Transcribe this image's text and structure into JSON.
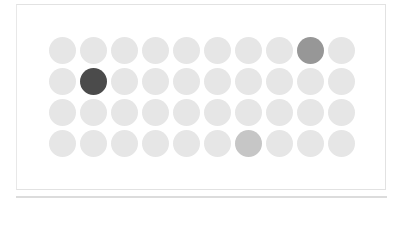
{
  "grid": {
    "rows": 4,
    "columns": 10,
    "base_color": "#e6e6e6",
    "highlights": [
      {
        "row": 1,
        "col": 9,
        "color": "#979797"
      },
      {
        "row": 2,
        "col": 2,
        "color": "#4b4b4b"
      },
      {
        "row": 4,
        "col": 7,
        "color": "#c6c6c6"
      }
    ]
  }
}
